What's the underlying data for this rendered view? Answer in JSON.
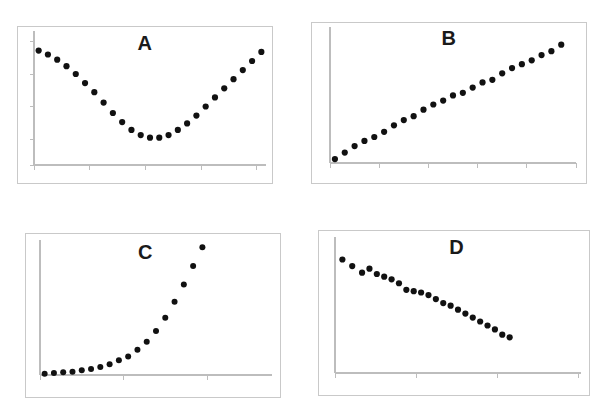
{
  "figure": {
    "background_color": "#ffffff",
    "panel_border_color": "#c9c9c9",
    "axis_color": "#bdbdbd",
    "point_color": "#111111",
    "layout": "2x2 grid of scatter plot panels"
  },
  "panels": [
    {
      "id": "A",
      "label": "A",
      "label_x_pct": 50,
      "label_y_pct": 8
    },
    {
      "id": "B",
      "label": "B",
      "label_x_pct": 50,
      "label_y_pct": 8
    },
    {
      "id": "C",
      "label": "C",
      "label_x_pct": 50,
      "label_y_pct": 8
    },
    {
      "id": "D",
      "label": "D",
      "label_x_pct": 50,
      "label_y_pct": 8
    }
  ],
  "chart_data": [
    {
      "type": "scatter",
      "title": "A",
      "xlabel": "",
      "ylabel": "",
      "xlim": [
        0,
        100
      ],
      "ylim": [
        0,
        100
      ],
      "grid": false,
      "legend": false,
      "axis_tick_labels": false,
      "shape": "parabolic / U-shaped minimum",
      "x_ticks": [
        0,
        24,
        48,
        72,
        96
      ],
      "y_ticks": [
        0,
        20,
        45,
        70,
        95
      ],
      "x": [
        2,
        6,
        10,
        14,
        18,
        22,
        26,
        30,
        34,
        38,
        42,
        46,
        50,
        54,
        58,
        62,
        66,
        70,
        74,
        78,
        82,
        86,
        90,
        94,
        98
      ],
      "y": [
        88,
        85,
        81,
        76,
        70,
        63,
        56,
        48,
        40,
        33,
        27,
        23,
        21,
        21,
        23,
        27,
        32,
        38,
        45,
        52,
        59,
        66,
        73,
        80,
        87
      ]
    },
    {
      "type": "scatter",
      "title": "B",
      "xlabel": "",
      "ylabel": "",
      "xlim": [
        0,
        100
      ],
      "ylim": [
        0,
        100
      ],
      "grid": false,
      "legend": false,
      "axis_tick_labels": false,
      "shape": "linear increasing",
      "x_ticks": [
        0,
        20,
        40,
        60,
        80,
        100
      ],
      "y_ticks": [],
      "x": [
        2,
        6,
        10,
        14,
        18,
        22,
        26,
        30,
        34,
        38,
        42,
        46,
        50,
        54,
        58,
        62,
        66,
        70,
        74,
        78,
        82,
        86,
        90,
        94
      ],
      "y": [
        3,
        8,
        13,
        17,
        20,
        24,
        29,
        33,
        36,
        41,
        45,
        48,
        52,
        54,
        58,
        62,
        64,
        69,
        73,
        76,
        79,
        83,
        86,
        91
      ]
    },
    {
      "type": "scatter",
      "title": "C",
      "xlabel": "",
      "ylabel": "",
      "xlim": [
        0,
        100
      ],
      "ylim": [
        0,
        100
      ],
      "grid": false,
      "legend": false,
      "axis_tick_labels": false,
      "shape": "exponential growth",
      "x_ticks": [
        0,
        36,
        72
      ],
      "y_ticks": [],
      "x": [
        2,
        6,
        10,
        14,
        18,
        22,
        26,
        30,
        34,
        38,
        42,
        46,
        50,
        54,
        58,
        62,
        66,
        70
      ],
      "y": [
        1,
        1.5,
        2,
        2.5,
        3.5,
        4.5,
        6,
        8,
        11,
        14,
        19,
        25,
        33,
        43,
        55,
        68,
        82,
        96
      ]
    },
    {
      "type": "scatter",
      "title": "D",
      "xlabel": "",
      "ylabel": "",
      "xlim": [
        0,
        100
      ],
      "ylim": [
        0,
        100
      ],
      "grid": false,
      "legend": false,
      "axis_tick_labels": false,
      "shape": "linear decreasing",
      "x_ticks": [
        0,
        33,
        66,
        99
      ],
      "y_ticks": [],
      "x": [
        3,
        7,
        11,
        14,
        17,
        20,
        23,
        26,
        29,
        32,
        35,
        38,
        41,
        44,
        47,
        50,
        53,
        56,
        59,
        62,
        65,
        68,
        71
      ],
      "y": [
        86,
        81,
        76,
        79,
        75,
        73,
        71,
        68,
        63,
        62,
        61,
        59,
        56,
        53,
        51,
        48,
        45,
        42,
        39,
        36,
        33,
        29,
        27
      ]
    }
  ]
}
